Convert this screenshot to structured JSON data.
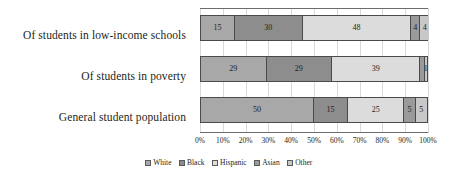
{
  "chart_data": {
    "type": "bar",
    "orientation": "horizontal",
    "stacked": true,
    "stack_total": 100,
    "title": "",
    "subtitle": "",
    "xlabel": "",
    "ylabel": "",
    "xlim": [
      0,
      100
    ],
    "grid": true,
    "legend_position": "bottom",
    "categories": [
      "Of students in low-income schools",
      "Of students in poverty",
      "General student population"
    ],
    "xticks": [
      "0%",
      "10%",
      "20%",
      "30%",
      "40%",
      "50%",
      "60%",
      "70%",
      "80%",
      "90%",
      "100%"
    ],
    "xtick_values": [
      0,
      10,
      20,
      30,
      40,
      50,
      60,
      70,
      80,
      90,
      100
    ],
    "series": [
      {
        "name": "White",
        "color": "#a8a8a8",
        "values": [
          15,
          29,
          50
        ],
        "labels": [
          "15",
          "29",
          "50"
        ]
      },
      {
        "name": "Black",
        "color": "#8d8d8d",
        "values": [
          30,
          29,
          15
        ],
        "labels": [
          "30",
          "29",
          "15"
        ]
      },
      {
        "name": "Hispanic",
        "color": "#dcdcdc",
        "values": [
          48,
          39,
          25
        ],
        "labels": [
          "48",
          "39",
          "25"
        ]
      },
      {
        "name": "Asian",
        "color": "#9a9a9a",
        "values": [
          4,
          2,
          5
        ],
        "labels": [
          "4",
          "",
          "5"
        ]
      },
      {
        "name": "Other",
        "color": "#c8c8c8",
        "values": [
          4,
          1,
          5
        ],
        "labels": [
          "4",
          "1",
          "5"
        ]
      }
    ]
  }
}
